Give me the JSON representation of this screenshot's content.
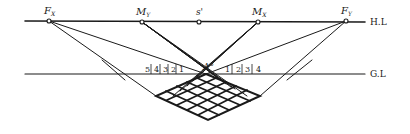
{
  "diagram": {
    "type": "perspective-measuring-points-grid",
    "lines": {
      "horizon": {
        "label": "H.L",
        "y": 21,
        "x1": 25,
        "x2": 365
      },
      "ground": {
        "label": "G.L",
        "y": 74,
        "x1": 25,
        "x2": 365
      }
    },
    "points": {
      "fx": {
        "label": "F",
        "sub": "X",
        "x": 49,
        "y": 21
      },
      "my": {
        "label": "M",
        "sub": "Y",
        "x": 142,
        "y": 22
      },
      "s": {
        "label": "s'",
        "x": 199,
        "y": 22
      },
      "mx": {
        "label": "M",
        "sub": "X",
        "x": 258,
        "y": 22
      },
      "fy": {
        "label": "F",
        "sub": "Y",
        "x": 346,
        "y": 21
      },
      "a": {
        "label": "A°",
        "x": 206,
        "y": 74
      }
    },
    "left_ticks": [
      "5",
      "4",
      "3",
      "2",
      "1"
    ],
    "right_ticks": [
      "1",
      "2",
      "3",
      "4"
    ],
    "grid": {
      "rows": 4,
      "cols": 5
    },
    "stroke_color": "#1a1a1a"
  }
}
